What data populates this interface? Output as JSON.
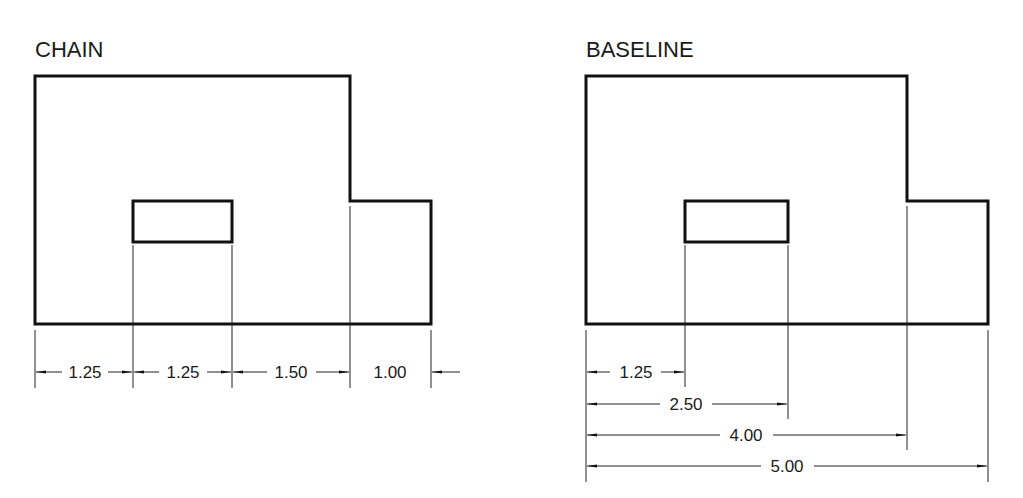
{
  "chain": {
    "title": "CHAIN",
    "dimensions": [
      {
        "label": "1.25",
        "from": 0,
        "to": 1.25
      },
      {
        "label": "1.25",
        "from": 1.25,
        "to": 2.5
      },
      {
        "label": "1.50",
        "from": 2.5,
        "to": 4.0
      },
      {
        "label": "1.00",
        "from": 4.0,
        "to": 5.0
      }
    ]
  },
  "baseline": {
    "title": "BASELINE",
    "dimensions": [
      {
        "label": "1.25",
        "from": 0,
        "to": 1.25
      },
      {
        "label": "2.50",
        "from": 0,
        "to": 2.5
      },
      {
        "label": "4.00",
        "from": 0,
        "to": 4.0
      },
      {
        "label": "5.00",
        "from": 0,
        "to": 5.0
      }
    ]
  },
  "colors": {
    "line": "#111111",
    "background": "#ffffff"
  }
}
